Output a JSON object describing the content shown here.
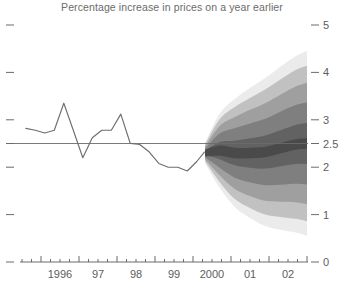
{
  "chart": {
    "title": "Percentage increase in prices on a year earlier"
  },
  "chart_data": {
    "type": "area",
    "title": "Percentage increase in prices on a year earlier",
    "xlabel": "",
    "ylabel": "",
    "ylim": [
      0,
      5
    ],
    "xlim": [
      1995.5,
      2003.0
    ],
    "grid": false,
    "legend": "none",
    "yticks": [
      0,
      1,
      2,
      2.5,
      3,
      4,
      5
    ],
    "ytick_labels": [
      "0",
      "1",
      "2",
      "2.5",
      "3",
      "4",
      "5"
    ],
    "ytick_side": "right",
    "xticks": [
      1996,
      1997,
      1998,
      1999,
      2000,
      2001,
      2002
    ],
    "xtick_labels": [
      "1996",
      "97",
      "98",
      "99",
      "2000",
      "01",
      "02"
    ],
    "minor_xticks_per_year": 4,
    "reference_line": {
      "value": 2.5,
      "label": "2.5",
      "orientation": "horizontal"
    },
    "series": [
      {
        "name": "Historical inflation",
        "type": "line",
        "color": "#6e6e6e",
        "x": [
          1995.6,
          1995.85,
          1996.1,
          1996.35,
          1996.6,
          1996.85,
          1997.1,
          1997.35,
          1997.6,
          1997.85,
          1998.1,
          1998.35,
          1998.6,
          1998.85,
          1999.1,
          1999.35,
          1999.6,
          1999.85,
          2000.1,
          2000.3
        ],
        "values": [
          2.82,
          2.78,
          2.72,
          2.78,
          3.35,
          2.78,
          2.2,
          2.62,
          2.78,
          2.78,
          3.12,
          2.5,
          2.48,
          2.32,
          2.08,
          2.0,
          2.0,
          1.92,
          2.12,
          2.32
        ]
      }
    ],
    "fan": {
      "name": "Forecast probability fan",
      "start_x": 2000.32,
      "end_x": 2003.0,
      "central_color": "#4a4a4a",
      "outer_color": "#f2f2f2",
      "bands": 9,
      "x": [
        2000.32,
        2000.7,
        2001.1,
        2001.5,
        2001.9,
        2002.3,
        2002.7,
        2003.0
      ],
      "central": [
        2.3,
        2.35,
        2.3,
        2.3,
        2.32,
        2.4,
        2.48,
        2.5
      ],
      "band_half_widths": [
        {
          "percentile": 10,
          "values": [
            0.04,
            0.18,
            0.26,
            0.31,
            0.35,
            0.38,
            0.41,
            0.43
          ]
        },
        {
          "percentile": 30,
          "values": [
            0.09,
            0.36,
            0.52,
            0.62,
            0.7,
            0.77,
            0.83,
            0.87
          ]
        },
        {
          "percentile": 50,
          "values": [
            0.14,
            0.52,
            0.76,
            0.91,
            1.03,
            1.13,
            1.22,
            1.28
          ]
        },
        {
          "percentile": 70,
          "values": [
            0.18,
            0.66,
            0.97,
            1.16,
            1.32,
            1.45,
            1.57,
            1.64
          ]
        },
        {
          "percentile": 90,
          "values": [
            0.22,
            0.78,
            1.14,
            1.37,
            1.56,
            1.72,
            1.86,
            1.95
          ]
        }
      ]
    }
  },
  "axes": {
    "y_labels": [
      "5",
      "4",
      "3",
      "2.5",
      "2",
      "1",
      "0"
    ],
    "y_values": [
      5,
      4,
      3,
      2.5,
      2,
      1,
      0
    ],
    "x_labels": [
      "1996",
      "97",
      "98",
      "99",
      "2000",
      "01",
      "02"
    ],
    "x_values": [
      1996,
      1997,
      1998,
      1999,
      2000,
      2001,
      2002
    ]
  },
  "colors": {
    "line": "#6e6e6e",
    "axis": "#6b6b6b",
    "text": "#5d5d5d",
    "fan_dark": "#4a4a4a",
    "fan_light": "#f2f2f2",
    "background": "#ffffff"
  }
}
